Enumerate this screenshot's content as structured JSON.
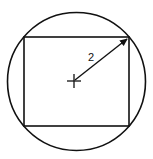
{
  "figure": {
    "stroke_color": "#111111",
    "background": "#ffffff",
    "circle": {
      "cx": 76.5,
      "cy": 81.5,
      "r": 69
    },
    "rectangle": {
      "x": 24,
      "y": 37,
      "width": 105,
      "height": 89
    },
    "center_mark": {
      "x": 74,
      "y": 81,
      "arm": 7
    },
    "radius_arrow": {
      "x1": 75,
      "y1": 80,
      "x2": 128,
      "y2": 38
    },
    "radius_label": {
      "text": "2",
      "x": 88,
      "y": 61
    }
  }
}
